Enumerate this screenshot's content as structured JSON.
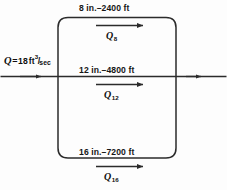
{
  "figure": {
    "line_color": "#2b2b2b",
    "background_color": "#fdfdfd",
    "inflow": {
      "variable": "Q",
      "equals": "=",
      "value": "18",
      "unit_base": "ft",
      "unit_exponent": "3",
      "unit_slash": "/",
      "unit_denominator": "sec",
      "full_text": "Q = 18 ft3/sec"
    },
    "pipes": [
      {
        "position": "top",
        "diameter": "8 in.",
        "dash": "–",
        "length": "2400 ft",
        "label": "8 in.–2400 ft",
        "flow_symbol": "Q",
        "flow_subscript": "8",
        "flow_label": "Q8",
        "flow_direction": "right"
      },
      {
        "position": "middle",
        "diameter": "12 in.",
        "dash": "–",
        "length": "4800 ft",
        "label": "12 in.–4800 ft",
        "flow_symbol": "Q",
        "flow_subscript": "12",
        "flow_label": "Q12",
        "flow_direction": "right"
      },
      {
        "position": "bottom",
        "diameter": "16 in.",
        "dash": "–",
        "length": "7200 ft",
        "label": "16 in.–7200 ft",
        "flow_symbol": "Q",
        "flow_subscript": "16",
        "flow_label": "Q16",
        "flow_direction": "right"
      }
    ]
  }
}
